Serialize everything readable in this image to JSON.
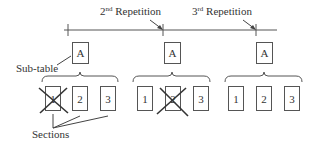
{
  "repetitions": [
    {
      "label_num": "2",
      "label_sup": "nd",
      "label_text": " Repetition"
    },
    {
      "label_num": "3",
      "label_sup": "rd",
      "label_text": " Repetition"
    }
  ],
  "subtable_label": "Sub-table",
  "sections_label": "Sections",
  "groups": [
    {
      "subtable": "A",
      "sections": [
        "1",
        "2",
        "3"
      ],
      "crossed_section_index": 0
    },
    {
      "subtable": "A",
      "sections": [
        "1",
        "2",
        "3"
      ],
      "crossed_section_index": 1
    },
    {
      "subtable": "A",
      "sections": [
        "1",
        "2",
        "3"
      ],
      "crossed_section_index": null
    }
  ],
  "colors": {
    "line": "#444444",
    "text": "#333333"
  }
}
